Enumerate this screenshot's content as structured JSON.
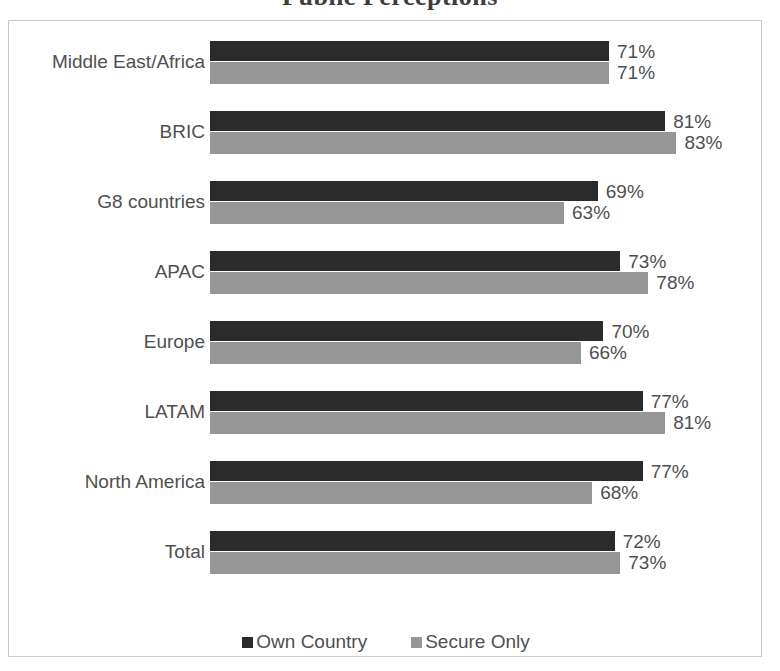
{
  "chart_data": {
    "type": "bar",
    "orientation": "horizontal",
    "title": "Public Perceptions",
    "xlabel": "",
    "ylabel": "",
    "xlim": [
      0,
      100
    ],
    "grid": false,
    "legend_position": "bottom",
    "value_suffix": "%",
    "categories": [
      "Middle East/Africa",
      "BRIC",
      "G8 countries",
      "APAC",
      "Europe",
      "LATAM",
      "North America",
      "Total"
    ],
    "series": [
      {
        "name": "Own Country",
        "color": "#2b2b2b",
        "values": [
          71,
          81,
          69,
          73,
          70,
          77,
          77,
          72
        ],
        "labels": [
          "71%",
          "81%",
          "69%",
          "73%",
          "70%",
          "77%",
          "77%",
          "72%"
        ]
      },
      {
        "name": "Secure Only",
        "color": "#969696",
        "values": [
          71,
          83,
          63,
          78,
          66,
          81,
          68,
          73
        ],
        "labels": [
          "71%",
          "83%",
          "63%",
          "78%",
          "66%",
          "81%",
          "68%",
          "73%"
        ]
      }
    ]
  },
  "colors": {
    "own_country": "#2b2b2b",
    "secure_only": "#969696",
    "text": "#4f4f4f",
    "frame": "#c9c9c9",
    "background": "#ffffff"
  }
}
